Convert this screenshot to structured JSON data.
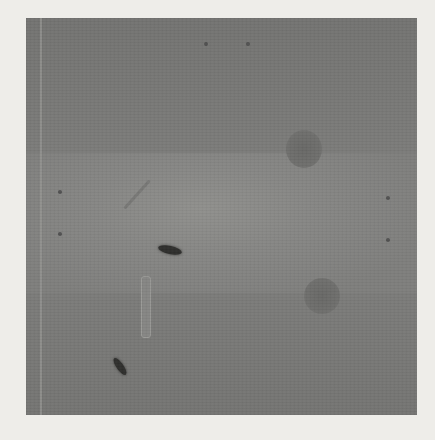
{
  "figure": {
    "type": "grayscale-photograph",
    "colors": {
      "page_background": "#eeede9",
      "plate_base": "#7a7a78",
      "plate_center_light": "#8f8f8c",
      "spot": "#686866",
      "streak": "#2e2e2c"
    },
    "features": [
      {
        "name": "round-spot-upper-right",
        "kind": "diffuse circular spot"
      },
      {
        "name": "round-spot-lower-right",
        "kind": "diffuse circular spot"
      },
      {
        "name": "dark-streak-center",
        "kind": "dark elongated mark"
      },
      {
        "name": "dark-streak-lower-left",
        "kind": "dark elongated mark"
      },
      {
        "name": "vertical-light-bar",
        "kind": "light vertical bar"
      },
      {
        "name": "faint-diagonal-streak",
        "kind": "faint diagonal mark"
      }
    ]
  }
}
